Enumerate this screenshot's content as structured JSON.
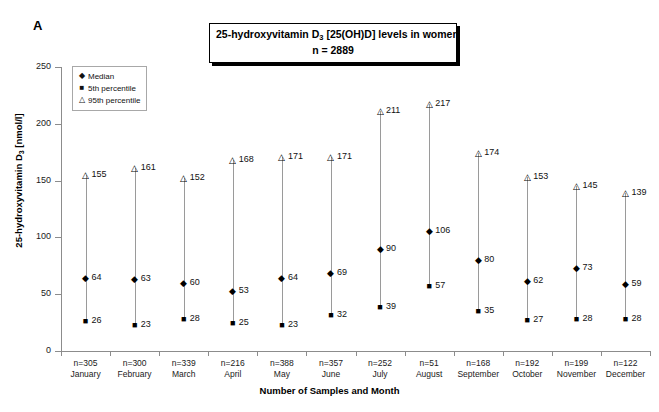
{
  "panel": {
    "label": "A"
  },
  "title": {
    "line1_prefix": "25-hydroxyvitamin D",
    "line1_sub": "3",
    "line1_suffix": " [25(OH)D] levels in women",
    "line2": "n = 2889"
  },
  "legend": {
    "position": "inside-top-left",
    "items": [
      {
        "glyph": "◆",
        "icon": "diamond-marker",
        "label": "Median"
      },
      {
        "glyph": "■",
        "icon": "square-marker",
        "label": "5th percentile"
      },
      {
        "glyph": "△",
        "icon": "triangle-marker",
        "label": "95th percentile"
      }
    ]
  },
  "axes": {
    "y_title_prefix": "25-hydroxyvitamin D",
    "y_title_sub": "3",
    "y_title_suffix": " [nmol/l]",
    "y_ticks": [
      0,
      50,
      100,
      150,
      200,
      250
    ],
    "x_title": "Number of Samples and Month"
  },
  "chart_data": {
    "type": "scatter",
    "title": "25-hydroxyvitamin D3 [25(OH)D] levels in women  n = 2889",
    "xlabel": "Number of Samples and Month",
    "ylabel": "25-hydroxyvitamin D3 [nmol/l]",
    "ylim": [
      0,
      250
    ],
    "yticks": [
      0,
      50,
      100,
      150,
      200,
      250
    ],
    "grid": false,
    "legend": [
      "Median",
      "5th percentile",
      "95th percentile"
    ],
    "total_n": 2889,
    "categories": [
      "January",
      "February",
      "March",
      "April",
      "May",
      "June",
      "July",
      "August",
      "September",
      "October",
      "November",
      "December"
    ],
    "sample_sizes": [
      305,
      300,
      339,
      216,
      388,
      357,
      252,
      51,
      168,
      192,
      199,
      122
    ],
    "sample_size_labels": [
      "n=305",
      "n=300",
      "n=339",
      "n=216",
      "n=388",
      "n=357",
      "n=252",
      "n=51",
      "n=168",
      "n=192",
      "n=199",
      "n=122"
    ],
    "series": [
      {
        "name": "Median",
        "marker": "diamond",
        "values": [
          64,
          63,
          60,
          53,
          64,
          69,
          90,
          106,
          80,
          62,
          73,
          59
        ]
      },
      {
        "name": "5th percentile",
        "marker": "square",
        "values": [
          26,
          23,
          28,
          25,
          23,
          32,
          39,
          57,
          35,
          27,
          28,
          28
        ]
      },
      {
        "name": "95th percentile",
        "marker": "triangle",
        "values": [
          155,
          161,
          152,
          168,
          171,
          171,
          211,
          217,
          174,
          153,
          145,
          139
        ]
      }
    ]
  }
}
